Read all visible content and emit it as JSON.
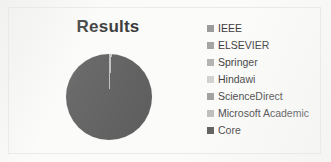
{
  "chart_data": {
    "type": "pie",
    "title": "Results",
    "categories": [
      "IEEE",
      "ELSEVIER",
      "Springer",
      "Hindawi",
      "ScienceDirect",
      "Microsoft Academic",
      "Core"
    ],
    "values": [
      0,
      0,
      0,
      0,
      0,
      1,
      99
    ],
    "slice_colors": [
      "#9a9a9a",
      "#a5a5a5",
      "#b4b4b4",
      "#c9c9c9",
      "#a0a0a0",
      "#bdbdbd",
      "#595959"
    ],
    "legend_position": "right",
    "grid": false,
    "xlabel": "",
    "ylabel": ""
  },
  "legend": {
    "entries": [
      {
        "label": "IEEE",
        "color": "#9a9a9a"
      },
      {
        "label": "ELSEVIER",
        "color": "#a5a5a5"
      },
      {
        "label": "Springer",
        "color": "#b4b4b4"
      },
      {
        "label": "Hindawi",
        "color": "#d2d2d2"
      },
      {
        "label": "ScienceDirect",
        "color": "#a0a0a0"
      },
      {
        "label": "Microsoft Academic",
        "color": "#bdbdbd"
      },
      {
        "label": "Core",
        "color": "#595959"
      }
    ]
  }
}
